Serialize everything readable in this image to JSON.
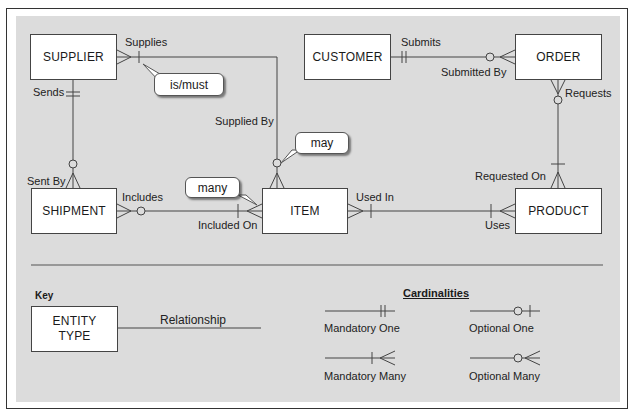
{
  "colors": {
    "panel_background": "#dcdcdc",
    "line": "#444444",
    "entity_fill": "#ffffff"
  },
  "entities": {
    "supplier": "SUPPLIER",
    "customer": "CUSTOMER",
    "order": "ORDER",
    "shipment": "SHIPMENT",
    "item": "ITEM",
    "product": "PRODUCT"
  },
  "relationship_labels": {
    "supplies": "Supplies",
    "supplied_by": "Supplied By",
    "sends": "Sends",
    "sent_by": "Sent By",
    "submits": "Submits",
    "submitted_by": "Submitted By",
    "requests": "Requests",
    "requested_on": "Requested On",
    "includes": "Includes",
    "included_on": "Included On",
    "used_in": "Used In",
    "uses": "Uses"
  },
  "relationships": [
    {
      "from": "SUPPLIER",
      "to": "ITEM",
      "from_label": "Supplies",
      "to_label": "Supplied By",
      "from_end": "many",
      "to_end": "optional-many"
    },
    {
      "from": "SUPPLIER",
      "to": "SHIPMENT",
      "from_label": "Sends",
      "to_label": "Sent By",
      "from_end": "mandatory-one",
      "to_end": "optional-many"
    },
    {
      "from": "CUSTOMER",
      "to": "ORDER",
      "from_label": "Submits",
      "to_label": "Submitted By",
      "from_end": "mandatory-one",
      "to_end": "optional-many"
    },
    {
      "from": "ORDER",
      "to": "PRODUCT",
      "from_label": "Requests",
      "to_label": "Requested On",
      "from_end": "optional-many",
      "to_end": "mandatory-many"
    },
    {
      "from": "SHIPMENT",
      "to": "ITEM",
      "from_label": "Includes",
      "to_label": "Included On",
      "from_end": "optional-many",
      "to_end": "mandatory-many"
    },
    {
      "from": "ITEM",
      "to": "PRODUCT",
      "from_label": "Used In",
      "to_label": "Uses",
      "from_end": "mandatory-many",
      "to_end": "mandatory-many"
    }
  ],
  "callouts": {
    "is_must": "is/must",
    "may": "may",
    "many": "many"
  },
  "key": {
    "title": "Key",
    "entity_line1": "ENTITY",
    "entity_line2": "TYPE",
    "relationship": "Relationship"
  },
  "cardinalities": {
    "title": "Cardinalities",
    "mandatory_one": "Mandatory One",
    "optional_one": "Optional One",
    "mandatory_many": "Mandatory Many",
    "optional_many": "Optional Many"
  }
}
